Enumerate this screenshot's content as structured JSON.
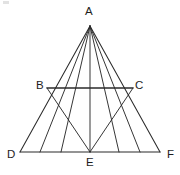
{
  "figure": {
    "canvas": {
      "width": 180,
      "height": 175,
      "background": "#ffffff"
    },
    "stroke_color": "#2b2b2b",
    "label_color": "#1e1e1e",
    "points": {
      "A": {
        "label": "A",
        "x": 90,
        "y": 26
      },
      "B": {
        "label": "B",
        "x": 47,
        "y": 88
      },
      "C": {
        "label": "C",
        "x": 133,
        "y": 88
      },
      "D": {
        "label": "D",
        "x": 20,
        "y": 152
      },
      "E": {
        "label": "E",
        "x": 90,
        "y": 152
      },
      "F": {
        "label": "F",
        "x": 160,
        "y": 152
      }
    },
    "base_divisions": [
      {
        "name": "D",
        "x": 20,
        "y": 152
      },
      {
        "name": "p1",
        "x": 40,
        "y": 152
      },
      {
        "name": "p2",
        "x": 61,
        "y": 152
      },
      {
        "name": "E",
        "x": 90,
        "y": 152
      },
      {
        "name": "p4",
        "x": 119,
        "y": 152
      },
      {
        "name": "p5",
        "x": 140,
        "y": 152
      },
      {
        "name": "F",
        "x": 160,
        "y": 152
      }
    ],
    "segments": [
      {
        "name": "side-AD",
        "kind": "edge",
        "x1": 90,
        "y1": 26,
        "x2": 20,
        "y2": 152
      },
      {
        "name": "side-AF",
        "kind": "edge",
        "x1": 90,
        "y1": 26,
        "x2": 160,
        "y2": 152
      },
      {
        "name": "base-DF",
        "kind": "baseline",
        "x1": 20,
        "y1": 152,
        "x2": 160,
        "y2": 152
      },
      {
        "name": "midline-BC",
        "kind": "midline",
        "x1": 47,
        "y1": 88,
        "x2": 133,
        "y2": 88
      },
      {
        "name": "cevian-A-p1",
        "kind": "cevian",
        "x1": 90,
        "y1": 26,
        "x2": 40,
        "y2": 152
      },
      {
        "name": "cevian-A-p2",
        "kind": "cevian",
        "x1": 90,
        "y1": 26,
        "x2": 61,
        "y2": 152
      },
      {
        "name": "cevian-A-E",
        "kind": "cevian",
        "x1": 90,
        "y1": 26,
        "x2": 90,
        "y2": 152
      },
      {
        "name": "cevian-A-p4",
        "kind": "cevian",
        "x1": 90,
        "y1": 26,
        "x2": 119,
        "y2": 152
      },
      {
        "name": "cevian-A-p5",
        "kind": "cevian",
        "x1": 90,
        "y1": 26,
        "x2": 140,
        "y2": 152
      },
      {
        "name": "crossline-B-E",
        "kind": "crossline",
        "x1": 47,
        "y1": 88,
        "x2": 90,
        "y2": 152
      },
      {
        "name": "crossline-C-E",
        "kind": "crossline",
        "x1": 133,
        "y1": 88,
        "x2": 90,
        "y2": 152
      }
    ],
    "labels": [
      "A",
      "B",
      "C",
      "D",
      "E",
      "F"
    ]
  }
}
